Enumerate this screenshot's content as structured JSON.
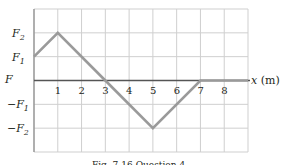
{
  "chart_data": {
    "type": "line",
    "title": "",
    "caption": "Fig. 7-16  Question 4.",
    "xlabel": "x (m)",
    "ylabel": "F",
    "x_ticks": [
      "1",
      "2",
      "3",
      "4",
      "5",
      "6",
      "7",
      "8"
    ],
    "y_ticks": [
      "F2",
      "F1",
      "-F1",
      "-F2"
    ],
    "y_tick_values": [
      2,
      1,
      -1,
      -2
    ],
    "xlim": [
      0,
      9
    ],
    "ylim": [
      -3,
      3
    ],
    "grid": true,
    "series": [
      {
        "name": "F(x)",
        "x": [
          0,
          1,
          3,
          5,
          7,
          9
        ],
        "y": [
          1,
          2,
          0,
          -2,
          0,
          0
        ]
      }
    ],
    "colors": {
      "line": "#9a9a9a",
      "grid": "#cfcfcf",
      "axis": "#555555",
      "text": "#231f20"
    }
  },
  "labels": {
    "y_axis": "F",
    "x_axis": "x (m)",
    "f2": "F",
    "f2_sub": "2",
    "f1": "F",
    "f1_sub": "1",
    "neg_f1": "−F",
    "neg_f1_sub": "1",
    "neg_f2": "−F",
    "neg_f2_sub": "2",
    "caption": "Fig. 7-16  Question 4."
  }
}
